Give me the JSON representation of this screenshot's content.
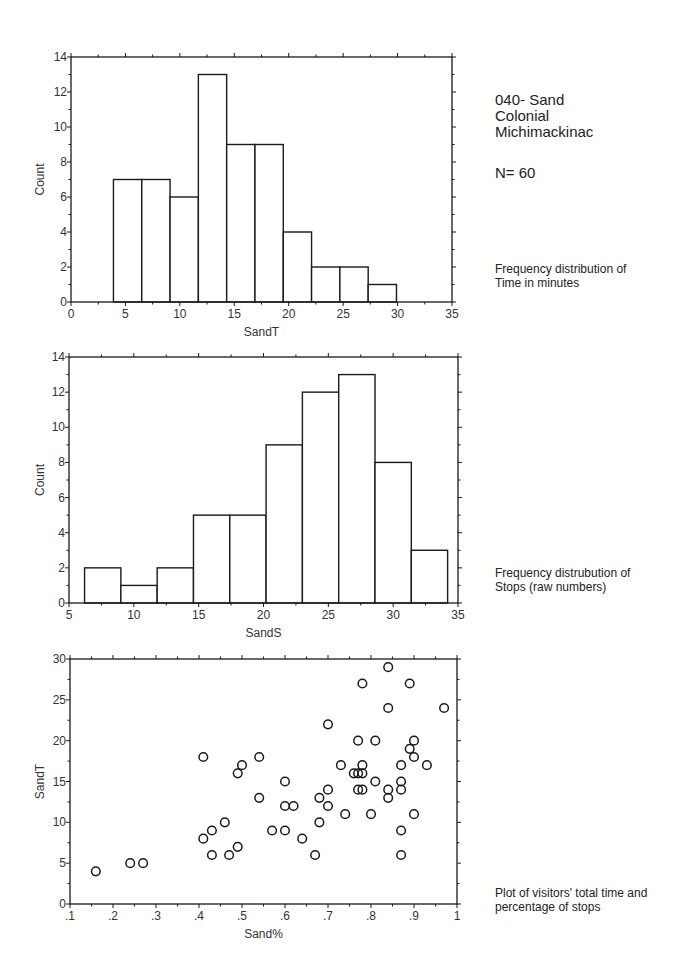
{
  "header": {
    "line1": "040- Sand",
    "line2": "Colonial",
    "line3": "Michimackinac",
    "n_label": "N= 60"
  },
  "captions": {
    "chart1": [
      "Frequency distribution of",
      "Time in minutes"
    ],
    "chart2": [
      "Frequency distrubution of",
      "Stops (raw numbers)"
    ],
    "chart3": [
      "Plot of visitors' total time and",
      "percentage of stops"
    ]
  },
  "chart_data": [
    {
      "type": "bar",
      "subtype": "histogram",
      "title": "Frequency distribution of Time in minutes",
      "xlabel": "SandT",
      "ylabel": "Count",
      "xlim": [
        0,
        35
      ],
      "ylim": [
        0,
        14
      ],
      "xticks": [
        0,
        5,
        10,
        15,
        20,
        25,
        30,
        35
      ],
      "yticks": [
        0,
        2,
        4,
        6,
        8,
        10,
        12,
        14
      ],
      "bin_edges": [
        3.9,
        6.5,
        9.1,
        11.7,
        14.3,
        16.9,
        19.5,
        22.1,
        24.7,
        27.3,
        29.9
      ],
      "values": [
        7,
        7,
        6,
        13,
        9,
        9,
        4,
        2,
        2,
        1
      ],
      "grid": false,
      "frame": {
        "x0": 71,
        "y0": 57,
        "x1": 452,
        "y1": 302
      }
    },
    {
      "type": "bar",
      "subtype": "histogram",
      "title": "Frequency distrubution of Stops (raw numbers)",
      "xlabel": "SandS",
      "ylabel": "Count",
      "xlim": [
        5,
        35
      ],
      "ylim": [
        0,
        14
      ],
      "xticks": [
        5,
        10,
        15,
        20,
        25,
        30,
        35
      ],
      "yticks": [
        0,
        2,
        4,
        6,
        8,
        10,
        12,
        14
      ],
      "bin_edges": [
        6.2,
        9.0,
        11.8,
        14.6,
        17.4,
        20.2,
        23.0,
        25.8,
        28.6,
        31.4,
        34.2
      ],
      "values": [
        2,
        1,
        2,
        5,
        5,
        9,
        12,
        13,
        8,
        3
      ],
      "grid": false,
      "frame": {
        "x0": 69,
        "y0": 357,
        "x1": 458,
        "y1": 603
      }
    },
    {
      "type": "scatter",
      "title": "Plot of visitors' total time and percentage of stops",
      "xlabel": "Sand%",
      "ylabel": "SandT",
      "xlim": [
        0.1,
        1.0
      ],
      "ylim": [
        0,
        30
      ],
      "xticks": [
        ".1",
        ".2",
        ".3",
        ".4",
        ".5",
        ".6",
        ".7",
        ".8",
        ".9",
        "1"
      ],
      "yticks": [
        0,
        5,
        10,
        15,
        20,
        25,
        30
      ],
      "marker": "open-circle",
      "grid": false,
      "frame": {
        "x0": 70,
        "y0": 659,
        "x1": 457,
        "y1": 904
      },
      "points": [
        [
          0.16,
          4
        ],
        [
          0.24,
          5
        ],
        [
          0.27,
          5
        ],
        [
          0.41,
          18
        ],
        [
          0.41,
          8
        ],
        [
          0.43,
          9
        ],
        [
          0.43,
          6
        ],
        [
          0.46,
          10
        ],
        [
          0.47,
          6
        ],
        [
          0.49,
          16
        ],
        [
          0.49,
          7
        ],
        [
          0.5,
          17
        ],
        [
          0.54,
          18
        ],
        [
          0.54,
          13
        ],
        [
          0.57,
          9
        ],
        [
          0.6,
          12
        ],
        [
          0.6,
          9
        ],
        [
          0.6,
          15
        ],
        [
          0.62,
          12
        ],
        [
          0.64,
          8
        ],
        [
          0.67,
          6
        ],
        [
          0.68,
          13
        ],
        [
          0.68,
          10
        ],
        [
          0.7,
          14
        ],
        [
          0.7,
          22
        ],
        [
          0.7,
          12
        ],
        [
          0.73,
          17
        ],
        [
          0.74,
          11
        ],
        [
          0.76,
          16
        ],
        [
          0.77,
          16
        ],
        [
          0.77,
          20
        ],
        [
          0.77,
          14
        ],
        [
          0.78,
          27
        ],
        [
          0.78,
          17
        ],
        [
          0.78,
          16
        ],
        [
          0.78,
          14
        ],
        [
          0.8,
          11
        ],
        [
          0.81,
          20
        ],
        [
          0.81,
          15
        ],
        [
          0.84,
          29
        ],
        [
          0.84,
          24
        ],
        [
          0.84,
          14
        ],
        [
          0.84,
          13
        ],
        [
          0.87,
          17
        ],
        [
          0.87,
          15
        ],
        [
          0.87,
          14
        ],
        [
          0.87,
          9
        ],
        [
          0.87,
          6
        ],
        [
          0.89,
          27
        ],
        [
          0.89,
          19
        ],
        [
          0.9,
          20
        ],
        [
          0.9,
          18
        ],
        [
          0.9,
          11
        ],
        [
          0.93,
          17
        ],
        [
          0.97,
          24
        ]
      ]
    }
  ]
}
